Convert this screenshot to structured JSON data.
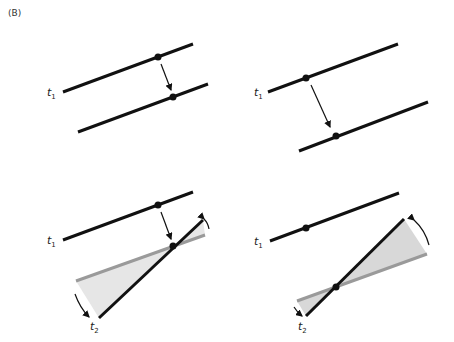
{
  "panel_label": "(B)",
  "labels": {
    "t1": "t",
    "t1_sub": "1",
    "t2": "t",
    "t2_sub": "2"
  },
  "colors": {
    "line": "#111111",
    "gray_line": "#9a9a9a",
    "wedge": "#e3e3e3",
    "wedge_dark": "#d4d4d4"
  }
}
